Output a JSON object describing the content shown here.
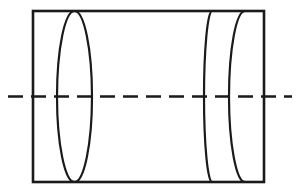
{
  "figure": {
    "background_color": "#ffffff",
    "stroke_color": "#1a1a1a",
    "canvas": {
      "width": 300,
      "height": 194
    }
  },
  "geometry": {
    "outline_rect": {
      "name": "cylinder-body-outline",
      "x": 33,
      "y": 11,
      "width": 231,
      "height": 171,
      "stroke_width": 2.6
    },
    "full_ellipse": {
      "name": "left-end-ellipse",
      "cx": 74.5,
      "cy": 96.5,
      "rx": 17.5,
      "ry": 85.5,
      "stroke_width": 2.2
    },
    "arcs": [
      {
        "name": "right-inner-arc",
        "top_x": 212,
        "bottom_x": 212,
        "apex_x": 204,
        "top_y": 11,
        "bottom_y": 182,
        "cy": 96.5,
        "stroke_width": 2.2
      },
      {
        "name": "right-outer-arc",
        "top_x": 245,
        "bottom_x": 245,
        "apex_x": 229,
        "top_y": 11,
        "bottom_y": 182,
        "cy": 96.5,
        "stroke_width": 2.2
      }
    ],
    "centerline": {
      "name": "horizontal-axis-centerline",
      "x1": 8,
      "x2": 292,
      "y": 96.5,
      "stroke_width": 2.6,
      "dash_pattern": "15 8"
    }
  }
}
